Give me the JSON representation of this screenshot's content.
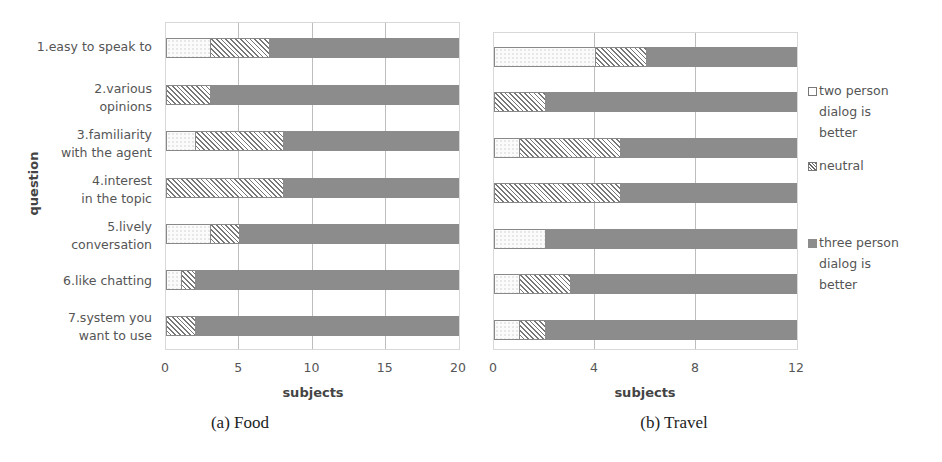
{
  "chart_data": [
    {
      "type": "bar",
      "orientation": "horizontal",
      "stacked": true,
      "title": "(a) Food",
      "xlabel": "subjects",
      "ylabel": "question",
      "xlim": [
        0,
        20
      ],
      "xticks": [
        "0",
        "5",
        "10",
        "15",
        "20"
      ],
      "grid": true,
      "categories": [
        "1.easy to speak to",
        "2.various opinions",
        "3.familiarity with the agent",
        "4.interest in the topic",
        "5.lively conversation",
        "6.like chatting",
        "7.system you want to use"
      ],
      "series": [
        {
          "name": "two person dialog is better",
          "values": [
            3,
            0,
            2,
            0,
            3,
            1,
            0
          ]
        },
        {
          "name": "neutral",
          "values": [
            4,
            3,
            6,
            8,
            2,
            1,
            2
          ]
        },
        {
          "name": "three person dialog is better",
          "values": [
            13,
            17,
            12,
            12,
            15,
            18,
            18
          ]
        }
      ]
    },
    {
      "type": "bar",
      "orientation": "horizontal",
      "stacked": true,
      "title": "(b) Travel",
      "xlabel": "subjects",
      "ylabel": "",
      "xlim": [
        0,
        12
      ],
      "xticks": [
        "0",
        "4",
        "8",
        "12"
      ],
      "grid": true,
      "categories": [
        "1.easy to speak to",
        "2.various opinions",
        "3.familiarity with the agent",
        "4.interest in the topic",
        "5.lively conversation",
        "6.like chatting",
        "7.system you want to use"
      ],
      "series": [
        {
          "name": "two person dialog is better",
          "values": [
            4,
            0,
            1,
            0,
            2,
            1,
            1
          ]
        },
        {
          "name": "neutral",
          "values": [
            2,
            2,
            4,
            5,
            0,
            2,
            1
          ]
        },
        {
          "name": "three person dialog is better",
          "values": [
            6,
            10,
            7,
            7,
            10,
            9,
            10
          ]
        }
      ],
      "legend_position": "right"
    }
  ],
  "labels": {
    "q1a": "1.easy to speak to",
    "q2a": "2.various",
    "q2b": "opinions",
    "q3a": "3.familiarity",
    "q3b": "with the agent",
    "q4a": "4.interest",
    "q4b": "in the topic",
    "q5a": "5.lively",
    "q5b": "conversation",
    "q6a": "6.like chatting",
    "q7a": "7.system you",
    "q7b": "want to use",
    "ytitle": "question",
    "xtitle_a": "subjects",
    "xtitle_b": "subjects",
    "caption_a": "(a) Food",
    "caption_b": "(b) Travel"
  },
  "ticks_a": [
    "0",
    "5",
    "10",
    "15",
    "20"
  ],
  "ticks_b": [
    "0",
    "4",
    "8",
    "12"
  ],
  "legend": {
    "two": [
      "two person",
      "dialog is",
      "better"
    ],
    "neutral": "neutral",
    "three": [
      "three person",
      "dialog is",
      "better"
    ]
  },
  "colors": {
    "three_person": "#8c8c8c",
    "grid": "#bdbdbd"
  }
}
